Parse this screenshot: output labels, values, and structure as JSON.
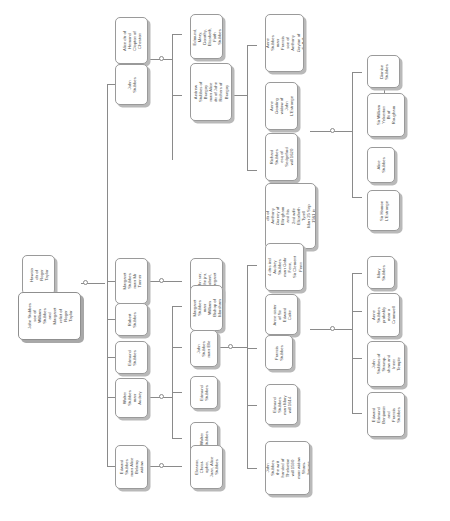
{
  "document": {
    "type": "genealogy-family-tree",
    "title": "Stubbes Family Tree",
    "orientation": "left-to-right, node text rotated 90 degrees",
    "colors": {
      "background": "#ffffff",
      "node_border": "#9a9a9a",
      "node_shadow": "#b9b9b9",
      "connector": "#8a8a8a",
      "text": "#4a4a4a"
    }
  },
  "nodes": {
    "root": "John Stubbes\nson of\nWilliam\nStubbes\nand\nMargaret\nrelict of\nRoger\nTaylor",
    "root_spouse": "Hawcia\ndtr of\nRoger\nTaylor",
    "john_stubbes_2": "John\nStubbes",
    "alice_clopton": "Alice dtr of\nHemond\nClopton of\nCheston",
    "andrew_stubbes": "Andrew\nStubbes of\nBungay\nmarr Alice\ndtr of John\nRichers of\nBungay",
    "edmund_mary_dorothy": "Edmund,\nMary,\nDorothy,\nElizabeth,\nFaith\nStubbes",
    "anne_stubbes_goyton": "Anne\nStubbes\nmarr\nFrancis\nson of\nAnthony\nGoyton of\nSuffolk",
    "anne_gooding": "Anne\nGooding\nwidow of\nJohn\nL'Estrange",
    "richard_stubbes": "Richard\nStubbes\nesq of\nSedgeford\nwill 1620",
    "elizabeth_gurney": "Elizabeth\ndtr of\nAnthony\nGurney of\nEllingham\nand his\n2nd wife\nElizabeth\nTyrell\nMarr 25 Sep\n1561 in\nViewed",
    "dionise_stubbes": "Dionise\nStubbes",
    "sir_william_yelverton": "Sir William\nYelverton\nBt of\nRougham",
    "alice_stubbes": "Alice\nStubbes",
    "sir_hamon_lestrange": "Sir Hamon\nL'Estrange",
    "margaret_stubbes_tanner": "Margaret\nStubbes\nmarr Mr\nTanner",
    "john_snr_jnr": "John snr,\nJohn jnr,\nRobert,\nMargaret",
    "robert_stubbes": "Robert\nStubbes",
    "edmund_stubbes": "Edmund\nStubbes",
    "walter_stubbes_audrey": "Walter\nStubbes\nmarr\nAudrey",
    "margaret_stubbes_william": "Margaret\nStubbes\nmarr\nWilliam\nBishop of\nMarsham",
    "john_stubbes_elle": "John\nStubbes\nmarr Elle",
    "edmund_stubbes_2": "Edmund\nStubbes",
    "walter_stubbes_2": "Walter\nStubbes",
    "four_dtrs_audrey": "4 dtrs incl\nAudrey\nStubbes\nmarr Gabr\nFenn,\nSir Clement\nFenn",
    "anne_coke": "Anne sister\nof Sir\nEdward\nCoke",
    "francis_stubbes": "Francis\nStubbes",
    "edmund_stubbes_mary": "Edmund\nStubbes\nmarr Mary\nwill 1614",
    "john_stubbes_thelveton": "John\nStubbes\nthe writ\nhanded of\nThelveton\nwill 1590\nmarr widow\nSham-\nbourne",
    "mary_stubbes": "Mary\nStubbes",
    "anne_stubbes_cromwell": "Anne\nStubbes\nprobably\nmarr a\nCromwell",
    "john_stubbes_strumpshaw": "John\nStubbes of\nStrump-\nshaw and\nInner\nTemple",
    "edward_edmund_benjamin": "Edward\nEdmund\nBenjamin\nand\nFrancis\nStubbes",
    "edward_stubbes_belamy": "Edward\nStubbes\nmarr Alice\nBelamy\nwidow",
    "eleanor_christopher": "Eleanor,\nChrist-\nopher,\nJoan, Alice\nStubbes"
  }
}
